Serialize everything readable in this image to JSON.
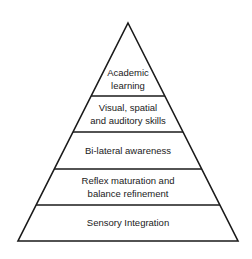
{
  "diagram": {
    "type": "pyramid",
    "stroke_color": "#1a1a1a",
    "fill_color": "#ffffff",
    "layers": [
      {
        "label_lines": [
          "Academic",
          "learning"
        ]
      },
      {
        "label_lines": [
          "Visual, spatial",
          "and auditory skills"
        ]
      },
      {
        "label_lines": [
          "Bi-lateral awareness"
        ]
      },
      {
        "label_lines": [
          "Reflex maturation and",
          "balance refinement"
        ]
      },
      {
        "label_lines": [
          "Sensory Integration"
        ]
      }
    ]
  }
}
